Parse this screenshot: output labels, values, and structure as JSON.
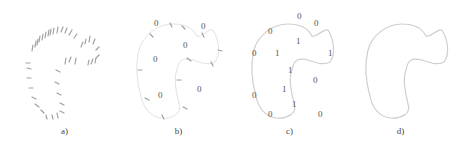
{
  "figure": {
    "panels": [
      {
        "id": "a",
        "caption": "a)",
        "content": "oriented-point-samples"
      },
      {
        "id": "b",
        "caption": "b)",
        "content": "points-with-outside-labels",
        "labels": [
          "0",
          "0",
          "0",
          "0",
          "0",
          "0"
        ]
      },
      {
        "id": "c",
        "caption": "c)",
        "content": "implicit-inside-outside-labels",
        "inside_labels": [
          "1",
          "1",
          "1",
          "1",
          "1",
          "1"
        ],
        "outside_labels": [
          "0",
          "0",
          "0",
          "0",
          "0",
          "0",
          "0",
          "0"
        ]
      },
      {
        "id": "d",
        "caption": "d)",
        "content": "reconstructed-contour"
      }
    ],
    "colors": {
      "curve": "#cfcfcf",
      "ticks": "#9a9a9a",
      "text": "#555555"
    }
  }
}
